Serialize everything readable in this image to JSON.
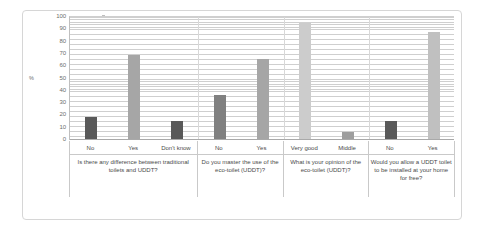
{
  "chart_data": {
    "type": "bar",
    "title": "",
    "subtitle": "",
    "xlabel": "",
    "ylabel": "%",
    "ylim": [
      0,
      100
    ],
    "ytick_labels": [
      "100",
      "90",
      "80",
      "70",
      "60",
      "50",
      "40",
      "30",
      "20",
      "10",
      "0"
    ],
    "ytick_values": [
      100,
      90,
      80,
      70,
      60,
      50,
      40,
      30,
      20,
      10,
      0
    ],
    "grid": true,
    "grid_orientation": "horizontal",
    "legend": "none",
    "legend_position": "none",
    "categories": [
      "No",
      "Yes",
      "Don't know",
      "No",
      "Yes",
      "Very good",
      "Middle",
      "No",
      "Yes"
    ],
    "values": [
      18,
      68,
      15,
      36,
      65,
      94,
      6,
      15,
      87
    ],
    "bar_colors": [
      "#595959",
      "#a6a6a6",
      "#595959",
      "#808080",
      "#a6a6a6",
      "#cccccc",
      "#9e9e9e",
      "#595959",
      "#c0c0c0"
    ],
    "groups": [
      {
        "question": "Is there any difference between traditional toilets and UDDT?",
        "categories": [
          "No",
          "Yes",
          "Don't know"
        ],
        "values": [
          18,
          68,
          15
        ]
      },
      {
        "question": "Do you master the use of the eco-toilet (UDDT)?",
        "categories": [
          "No",
          "Yes"
        ],
        "values": [
          36,
          65
        ]
      },
      {
        "question": "What is your opinion of the eco-toilet (UDDT)?",
        "categories": [
          "Very good",
          "Middle"
        ],
        "values": [
          94,
          6
        ]
      },
      {
        "question": "Would you allow a UDDT toilet to be installed at your home for free?",
        "categories": [
          "No",
          "Yes"
        ],
        "values": [
          15,
          87
        ]
      }
    ]
  },
  "axis": {
    "y_title": "%"
  },
  "colors": {
    "plot_background": "#ffffff",
    "gridline": "#cfcfcf",
    "frame_border": "#d6d6d6",
    "axis_line": "#a9a9a9",
    "tick_text": "#6d6d6d",
    "label_text": "#4a4a4a"
  }
}
